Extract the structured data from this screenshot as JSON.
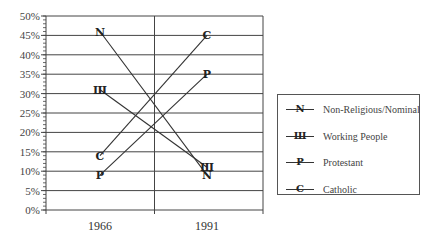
{
  "chart_data": {
    "type": "line",
    "title": "",
    "xlabel": "",
    "ylabel": "",
    "categories": [
      "1966",
      "1991"
    ],
    "ylim": [
      0,
      50
    ],
    "yticks": [
      "0%",
      "5%",
      "10%",
      "15%",
      "20%",
      "25%",
      "30%",
      "35%",
      "40%",
      "45%",
      "50%"
    ],
    "grid": true,
    "legend_position": "right",
    "series": [
      {
        "name": "Non-Religious/Nominal",
        "marker": "N",
        "values": [
          46,
          9
        ]
      },
      {
        "name": "Working People",
        "marker": "W",
        "values": [
          31,
          11
        ]
      },
      {
        "name": "Protestant",
        "marker": "P",
        "values": [
          9,
          35
        ]
      },
      {
        "name": "Catholic",
        "marker": "C",
        "values": [
          14,
          45
        ]
      }
    ]
  },
  "legend": {
    "items": [
      {
        "symbol": "N",
        "label": "Non-Religious/Nominal"
      },
      {
        "symbol": "Ш",
        "label": "Working People"
      },
      {
        "symbol": "P",
        "label": "Protestant"
      },
      {
        "symbol": "C",
        "label": "Catholic"
      }
    ]
  },
  "colors": {
    "line": "#333333",
    "grid": "#444444",
    "text": "#444444"
  }
}
